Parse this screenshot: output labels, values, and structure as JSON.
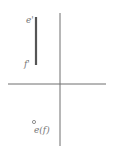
{
  "diagram": {
    "type": "orthographic-projection",
    "axis": {
      "vertical": {
        "x": 60,
        "y1": 13,
        "y2": 146
      },
      "horizontal": {
        "y": 84,
        "x1": 8,
        "x2": 106
      },
      "color": "#6e6e6e"
    },
    "line_segment": {
      "x": 36,
      "y1": 17,
      "y2": 65,
      "color": "#555555",
      "top_label": "e'",
      "bottom_label": "f'"
    },
    "point_projection": {
      "x": 34,
      "y": 122,
      "label": "e(f)"
    }
  }
}
